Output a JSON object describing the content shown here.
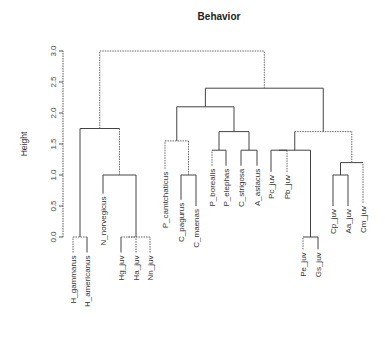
{
  "chart_data": {
    "type": "dendrogram",
    "title": "Behavior",
    "xlabel": "",
    "ylabel": "Height",
    "ylim": [
      0,
      3.0
    ],
    "yticks": [
      "0.0",
      "0.5",
      "1.0",
      "1.5",
      "2.0",
      "2.5",
      "3.0"
    ],
    "grid": false,
    "leaves": [
      {
        "label": "H_gammarus",
        "x": 73,
        "top": 0.0,
        "dotted": true
      },
      {
        "label": "H_americanus",
        "x": 87,
        "top": 0.0,
        "dotted": false
      },
      {
        "label": "N_norvegicus",
        "x": 103,
        "top": 0.7,
        "dotted": false
      },
      {
        "label": "Hg_juv",
        "x": 121,
        "top": 0.0,
        "dotted": false
      },
      {
        "label": "Ha_juv",
        "x": 136,
        "top": 0.0,
        "dotted": true
      },
      {
        "label": "Nn_juv",
        "x": 150,
        "top": 0.0,
        "dotted": true
      },
      {
        "label": "P_camtchaticus",
        "x": 165,
        "top": 1.1,
        "dotted": true
      },
      {
        "label": "C_pagurus",
        "x": 181,
        "top": 0.6,
        "dotted": false
      },
      {
        "label": "C_maenas",
        "x": 196,
        "top": 0.5,
        "dotted": false
      },
      {
        "label": "P_borealis",
        "x": 212,
        "top": 1.15,
        "dotted": true
      },
      {
        "label": "P_elephas",
        "x": 226,
        "top": 1.15,
        "dotted": false
      },
      {
        "label": "C_strigosa",
        "x": 241,
        "top": 1.15,
        "dotted": false
      },
      {
        "label": "A_astacus",
        "x": 257,
        "top": 1.15,
        "dotted": false
      },
      {
        "label": "Pc_juv",
        "x": 271,
        "top": 1.05,
        "dotted": false
      },
      {
        "label": "Pb_juv",
        "x": 287,
        "top": 1.05,
        "dotted": true
      },
      {
        "label": "Pe_juv",
        "x": 303,
        "top": -0.2,
        "dotted": true
      },
      {
        "label": "Gs_juv",
        "x": 318,
        "top": -0.2,
        "dotted": false
      },
      {
        "label": "Cp_juv",
        "x": 333,
        "top": 0.5,
        "dotted": false
      },
      {
        "label": "Aa_juv",
        "x": 348,
        "top": 0.5,
        "dotted": false
      },
      {
        "label": "Cm_juv",
        "x": 363,
        "top": 0.55,
        "dotted": true
      }
    ],
    "merges": [
      {
        "members": [
          "H_gammarus",
          "H_americanus"
        ],
        "height": 0.0
      },
      {
        "members": [
          "Hg_juv",
          "Ha_juv"
        ],
        "height": 0.0
      },
      {
        "members": [
          "Hg_juv+Ha_juv",
          "Nn_juv"
        ],
        "height": 0.0
      },
      {
        "members": [
          "N_norvegicus",
          "juv_group_1"
        ],
        "height": 1.0
      },
      {
        "members": [
          "H_group",
          "N_group"
        ],
        "height": 1.75
      },
      {
        "members": [
          "C_pagurus",
          "C_maenas"
        ],
        "height": 1.0
      },
      {
        "members": [
          "P_camtchaticus",
          "C_group"
        ],
        "height": 1.55
      },
      {
        "members": [
          "P_borealis",
          "P_elephas"
        ],
        "height": 1.4
      },
      {
        "members": [
          "C_strigosa",
          "A_astacus"
        ],
        "height": 1.4
      },
      {
        "members": [
          "P_group",
          "CA_group"
        ],
        "height": 1.7
      },
      {
        "members": [
          "PC_group",
          "PPCA_group"
        ],
        "height": 2.1
      },
      {
        "members": [
          "Pc_juv",
          "Pb_juv"
        ],
        "height": 1.4
      },
      {
        "members": [
          "Pe_juv",
          "Gs_juv"
        ],
        "height": 0.0
      },
      {
        "members": [
          "PcPb",
          "PeGs"
        ],
        "height": 1.4
      },
      {
        "members": [
          "Cp_juv",
          "Aa_juv"
        ],
        "height": 1.0
      },
      {
        "members": [
          "CpAa",
          "Cm_juv"
        ],
        "height": 1.2
      },
      {
        "members": [
          "juv_group_2",
          "juv_group_3"
        ],
        "height": 1.7
      },
      {
        "members": [
          "adult_group",
          "juv_right"
        ],
        "height": 2.4
      },
      {
        "members": [
          "left_cluster",
          "right_cluster"
        ],
        "height": 3.0
      }
    ]
  }
}
